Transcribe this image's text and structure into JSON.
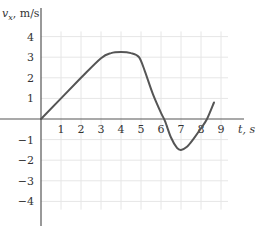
{
  "chart_data": {
    "type": "line",
    "title": "",
    "xlabel": "t, s",
    "ylabel": "v_x, m/s",
    "ylabel_main": "v",
    "ylabel_sub": "x",
    "ylabel_unit": ", m/s",
    "xlim": [
      0,
      9
    ],
    "ylim": [
      -4,
      4
    ],
    "grid": true,
    "legend": null,
    "x_ticks": [
      1,
      2,
      3,
      4,
      5,
      6,
      7,
      8,
      9
    ],
    "y_ticks": [
      4,
      3,
      2,
      1,
      -1,
      -2,
      -3,
      -4
    ],
    "x_tick_labels": [
      "1",
      "2",
      "3",
      "4",
      "5",
      "6",
      "7",
      "8",
      "9"
    ],
    "y_tick_labels": [
      "4",
      "3",
      "2",
      "1",
      "−1",
      "−2",
      "−3",
      "−4"
    ],
    "series": [
      {
        "name": "v_x(t)",
        "color": "#555555",
        "x": [
          0,
          1,
          2,
          3,
          3.5,
          4,
          4.5,
          4.9,
          5.2,
          5.6,
          6.0,
          6.2,
          6.5,
          6.8,
          7.0,
          7.3,
          7.6,
          8.0,
          8.3,
          8.65
        ],
        "values": [
          0,
          1,
          2,
          2.95,
          3.2,
          3.25,
          3.2,
          3.0,
          2.3,
          1.2,
          0.3,
          -0.1,
          -0.9,
          -1.4,
          -1.5,
          -1.35,
          -1.0,
          -0.45,
          0.0,
          0.8
        ]
      }
    ]
  }
}
